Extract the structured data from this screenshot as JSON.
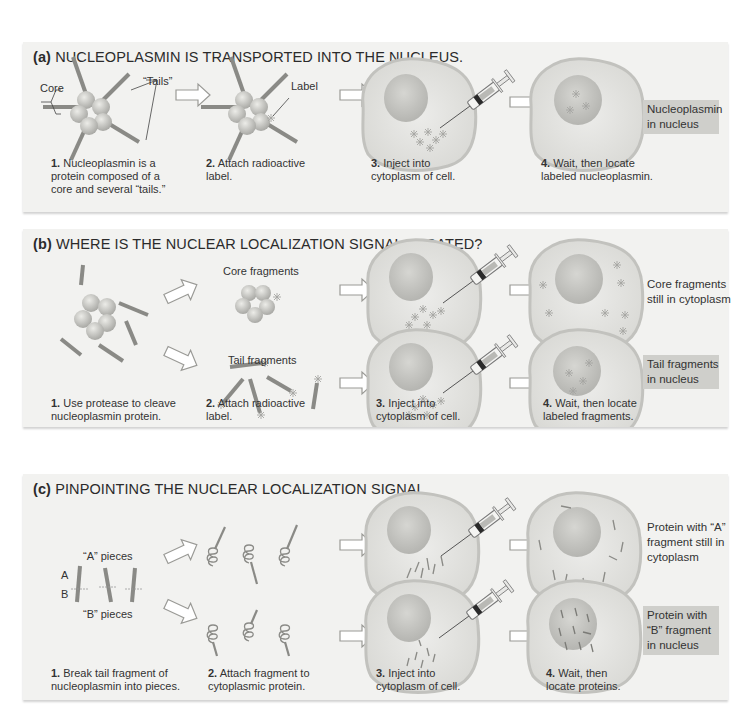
{
  "figure": {
    "colors": {
      "panel_bg": "#f2f2f0",
      "highlight_box": "#cfcfcb",
      "cell_fill": "#e6e6e2",
      "nucleus_fill": "#c9c9c5",
      "rod": "#8a8a86",
      "bead": "#c4c4c0",
      "text": "#333333"
    },
    "panels": [
      {
        "id": "a",
        "letter": "(a)",
        "title": "NUCLEOPLASMIN IS TRANSPORTED INTO THE NUCLEUS.",
        "labels": {
          "core": "Core",
          "tails": "“Tails”",
          "label": "Label"
        },
        "steps": [
          {
            "num": "1.",
            "text_l1": " Nucleoplasmin is a",
            "text_l2": "protein composed of a",
            "text_l3": "core and several “tails.”"
          },
          {
            "num": "2.",
            "text_l1": " Attach radioactive",
            "text_l2": "label."
          },
          {
            "num": "3.",
            "text_l1": " Inject into",
            "text_l2": "cytoplasm of cell."
          },
          {
            "num": "4.",
            "text_l1": " Wait, then locate",
            "text_l2": "labeled nucleoplasmin."
          }
        ],
        "result": {
          "l1": "Nucleoplasmin",
          "l2": "in nucleus",
          "highlighted": true
        }
      },
      {
        "id": "b",
        "letter": "(b)",
        "title": "WHERE IS THE NUCLEAR LOCALIZATION SIGNAL LOCATED?",
        "labels": {
          "core_fragments": "Core fragments",
          "tail_fragments": "Tail fragments"
        },
        "steps": [
          {
            "num": "1.",
            "text_l1": " Use protease to cleave",
            "text_l2": "nucleoplasmin protein."
          },
          {
            "num": "2.",
            "text_l1": " Attach radioactive",
            "text_l2": "label."
          },
          {
            "num": "3.",
            "text_l1": " Inject into",
            "text_l2": "cytoplasm of cell."
          },
          {
            "num": "4.",
            "text_l1": " Wait, then locate",
            "text_l2": "labeled fragments."
          }
        ],
        "results": [
          {
            "l1": "Core fragments",
            "l2": "still in cytoplasm",
            "highlighted": false
          },
          {
            "l1": "Tail fragments",
            "l2": "in nucleus",
            "highlighted": true
          }
        ]
      },
      {
        "id": "c",
        "letter": "(c)",
        "title": "PINPOINTING THE NUCLEAR LOCALIZATION SIGNAL",
        "labels": {
          "a_pieces": "“A” pieces",
          "b_pieces": "“B” pieces",
          "a": "A",
          "b": "B"
        },
        "steps": [
          {
            "num": "1.",
            "text_l1": " Break tail fragment of",
            "text_l2": "nucleoplasmin into pieces."
          },
          {
            "num": "2.",
            "text_l1": " Attach fragment to",
            "text_l2": "cytoplasmic protein."
          },
          {
            "num": "3.",
            "text_l1": " Inject into",
            "text_l2": "cytoplasm of cell."
          },
          {
            "num": "4.",
            "text_l1": " Wait, then",
            "text_l2": "locate proteins."
          }
        ],
        "results": [
          {
            "l1": "Protein with “A”",
            "l2": "fragment still in",
            "l3": "cytoplasm",
            "highlighted": false
          },
          {
            "l1": "Protein with",
            "l2": "“B”  fragment",
            "l3": "in nucleus",
            "highlighted": true
          }
        ]
      }
    ]
  }
}
